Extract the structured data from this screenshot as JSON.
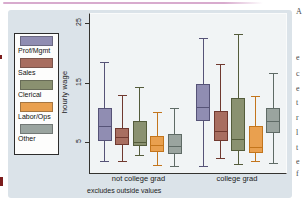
{
  "page": {
    "top_rule_color": "#d8abce",
    "edge_marks_color": "#7c1d1d",
    "right_column_fragments": [
      {
        "y": 8,
        "ch": "A"
      },
      {
        "y": 54,
        "ch": "e"
      },
      {
        "y": 70,
        "ch": "c"
      },
      {
        "y": 85,
        "ch": "e"
      },
      {
        "y": 99,
        "ch": "t"
      },
      {
        "y": 114,
        "ch": "r"
      },
      {
        "y": 129,
        "ch": "l"
      },
      {
        "y": 144,
        "ch": "t"
      },
      {
        "y": 158,
        "ch": "e"
      },
      {
        "y": 170,
        "ch": "f"
      }
    ]
  },
  "figure": {
    "background": "#dbe3e9",
    "plot_background": "#f1f4f5",
    "axis_color": "#34332f"
  },
  "legend": {
    "items": [
      {
        "label": "Prof/Mgmt",
        "fill": "#908db2",
        "stroke": "#565377"
      },
      {
        "label": "Sales",
        "fill": "#a86e60",
        "stroke": "#70392f"
      },
      {
        "label": "Clerical",
        "fill": "#8a9170",
        "stroke": "#545c3b"
      },
      {
        "label": "Labor/Ops",
        "fill": "#e9a04f",
        "stroke": "#c3751c"
      },
      {
        "label": "Other",
        "fill": "#9aa49f",
        "stroke": "#5f6b66"
      }
    ]
  },
  "chart_data": {
    "type": "box",
    "title": "",
    "ylabel": "hourly wage",
    "note": "excludes outside values",
    "yticks": [
      5,
      15,
      25
    ],
    "ylim": [
      0,
      26.5
    ],
    "grid": false,
    "legend_position": "left",
    "categories": [
      "Prof/Mgmt",
      "Sales",
      "Clerical",
      "Labor/Ops",
      "Other"
    ],
    "groups": [
      {
        "label": "not college grad",
        "boxes": [
          {
            "category": "Prof/Mgmt",
            "whisker_low": 1.9,
            "q1": 5.2,
            "median": 7.7,
            "q3": 10.8,
            "whisker_high": 18.4
          },
          {
            "category": "Sales",
            "whisker_low": 1.9,
            "q1": 4.5,
            "median": 5.9,
            "q3": 7.4,
            "whisker_high": 13.0
          },
          {
            "category": "Clerical",
            "whisker_low": 2.9,
            "q1": 4.3,
            "median": 5.0,
            "q3": 8.6,
            "whisker_high": 14.2
          },
          {
            "category": "Labor/Ops",
            "whisker_low": 1.2,
            "q1": 3.3,
            "median": 4.5,
            "q3": 6.0,
            "whisker_high": 10.0
          },
          {
            "category": "Other",
            "whisker_low": 1.0,
            "q1": 3.1,
            "median": 4.4,
            "q3": 6.4,
            "whisker_high": 10.8
          }
        ]
      },
      {
        "label": "college grad",
        "boxes": [
          {
            "category": "Prof/Mgmt",
            "whisker_low": 1.0,
            "q1": 8.5,
            "median": 10.9,
            "q3": 14.7,
            "whisker_high": 22.5
          },
          {
            "category": "Sales",
            "whisker_low": 2.3,
            "q1": 5.2,
            "median": 6.8,
            "q3": 10.2,
            "whisker_high": 18.1
          },
          {
            "category": "Clerical",
            "whisker_low": 1.3,
            "q1": 3.5,
            "median": 5.5,
            "q3": 12.4,
            "whisker_high": 23.2
          },
          {
            "category": "Labor/Ops",
            "whisker_low": 1.8,
            "q1": 3.2,
            "median": 4.2,
            "q3": 7.7,
            "whisker_high": 12.7
          },
          {
            "category": "Other",
            "whisker_low": 1.5,
            "q1": 6.5,
            "median": 8.5,
            "q3": 10.7,
            "whisker_high": 16.6
          }
        ]
      }
    ]
  }
}
